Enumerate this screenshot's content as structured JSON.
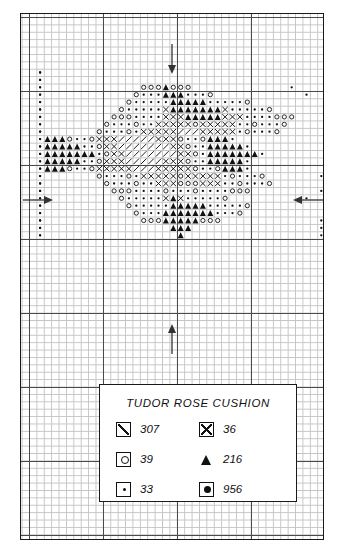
{
  "document": {
    "kind": "cross-stitch-chart",
    "legend": {
      "title": "TUDOR ROSE CUSHION",
      "entries": [
        {
          "icon": "boxed-diagonal-slash-icon",
          "symbol": "slash",
          "code": "307",
          "column": "left"
        },
        {
          "icon": "boxed-cross-icon",
          "symbol": "cross",
          "code": "36",
          "column": "right"
        },
        {
          "icon": "boxed-circle-icon",
          "symbol": "circle",
          "code": "39",
          "column": "left"
        },
        {
          "icon": "filled-triangle-icon",
          "symbol": "triangle",
          "code": "216",
          "column": "right"
        },
        {
          "icon": "boxed-small-dot-icon",
          "symbol": "dot",
          "code": "33",
          "column": "left"
        },
        {
          "icon": "boxed-filled-dot-icon",
          "symbol": "bigdot",
          "code": "956",
          "column": "right"
        }
      ]
    },
    "centering_marks": [
      {
        "name": "top-center-arrow",
        "direction": "down"
      },
      {
        "name": "bottom-center-arrow",
        "direction": "up"
      },
      {
        "name": "left-center-arrow",
        "direction": "right"
      },
      {
        "name": "right-center-arrow",
        "direction": "left"
      }
    ],
    "colors": {
      "ink": "#111111",
      "grid_fine": "#c4c4c4",
      "grid_bold": "#4a4a4a",
      "paper": "#ffffff"
    }
  },
  "chart_data": {
    "type": "heatmap",
    "title": "TUDOR ROSE CUSHION",
    "xlabel": "",
    "ylabel": "",
    "grid": true,
    "legend_position": "below-chart",
    "cell_size_px": 7.4,
    "bold_line_every": 10,
    "columns": 40,
    "rows": 36,
    "symbol_key": {
      "slash": "307",
      "cross": "36",
      "circle": "39",
      "triangle": "216",
      "dot": "33",
      "bigdot": "956"
    },
    "border_symbol": "dot",
    "border_note": "dotted outline frame of symbol 33 enclosing the rose motif",
    "rows_rle": [
      "0d40",
      "d1.38.d1",
      "d1.38.d1",
      "d1.13.o3.t1.o3.13.d1",
      "d1.12.o1.d3.t3.d3.o1.12.d1",
      "d1.11.o1.d5.t5.d5.o1.11.d1",
      "d1.10.o1.d5.c1.t7.c1.d5.o1.10.d1",
      "d1.9.o3.d4.c3.t5.c3.d4.o3.9.d1",
      "d1.8.o1.d3.o1.d2.c5.o1.c5.d2.o1.d3.o1.8.d1",
      "d1.7.o1.d3.o1.d1.c5.s3.c5.d1.o1.d3.o1.7.d1",
      "d1.t3.o1.d2.o1.c3.s5.c3.o1.d2.o1.t3.d1",
      "d1.t5.d2.o1.c2.s7.c2.o1.d2.t5.d1",
      "d1.t7.d1.o1.c2.s7.c2.o1.d1.t7.d1",
      "d1.t5.d2.o1.c3.s5.c3.o1.d2.t5.d1",
      "d1.t3.o1.d2.o1.c5.s3.c5.o1.d2.o1.t3.d1",
      "d1.7.o1.d3.o1.d1.c5.o1.c5.d1.o1.d3.o1.7.d1",
      "d1.8.o1.d3.o1.d2.c3.o3.c3.d2.o1.d3.o1.8.d1",
      "d1.9.o3.d4.o1.d3.o1.d4.o3.9.d1",
      "d1.10.o1.d5.c1.t1.c1.d5.o1.10.d1",
      "d1.11.o1.d5.t5.d5.o1.11.d1",
      "d1.12.o1.d3.t7.d3.o1.12.d1",
      "d1.13.o3.t5.o3.13.d1",
      "d1.17.t3.17.d1",
      "d1.18.t1.18.d1",
      "0d40"
    ]
  }
}
